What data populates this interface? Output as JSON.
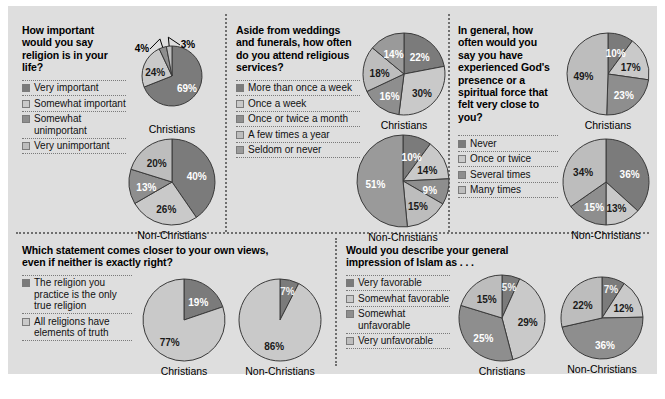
{
  "palette": {
    "board_bg": "#dedede",
    "page_bg": "#ffffff",
    "dark": "#7b7b7b",
    "light": "#c9c9c9",
    "mid_dark": "#8e8e8e",
    "mid_light": "#bdbdbd",
    "outline": "#3a3a3a",
    "divider": "#6f6f6f"
  },
  "labels": {
    "christians": "Christians",
    "non_christians": "Non-Christians"
  },
  "panels": [
    {
      "id": "religion-importance",
      "question": "How important would you say religion is in your life?",
      "legend": [
        {
          "label": "Very important",
          "color": "#7b7b7b"
        },
        {
          "label": "Somewhat important",
          "color": "#c9c9c9"
        },
        {
          "label": "Somewhat unimportant",
          "color": "#8e8e8e"
        },
        {
          "label": "Very unimportant",
          "color": "#bdbdbd"
        }
      ],
      "charts": [
        {
          "group": "Christians",
          "values": [
            69,
            24,
            4,
            3
          ],
          "display": [
            "69%",
            "24%",
            "4%",
            "3%"
          ]
        },
        {
          "group": "Non-Christians",
          "values": [
            40,
            26,
            13,
            20
          ],
          "display": [
            "40%",
            "26%",
            "13%",
            "20%"
          ]
        }
      ]
    },
    {
      "id": "attend-services",
      "question": "Aside from weddings and funerals, how often do you attend religious services?",
      "legend": [
        {
          "label": "More than once a week",
          "color": "#7b7b7b"
        },
        {
          "label": "Once a week",
          "color": "#c9c9c9"
        },
        {
          "label": "Once or twice a month",
          "color": "#8e8e8e"
        },
        {
          "label": "A few times a year",
          "color": "#bdbdbd"
        },
        {
          "label": "Seldom or never",
          "color": "#9a9a9a"
        }
      ],
      "charts": [
        {
          "group": "Christians",
          "values": [
            22,
            30,
            16,
            18,
            14
          ],
          "display": [
            "22%",
            "30%",
            "16%",
            "18%",
            "14%"
          ]
        },
        {
          "group": "Non-Christians",
          "values": [
            10,
            14,
            9,
            15,
            51
          ],
          "display": [
            "10%",
            "14%",
            "9%",
            "15%",
            "51%"
          ]
        }
      ]
    },
    {
      "id": "gods-presence",
      "question": "In general, how often would you say you have experienced God's presence or a spiritual force that felt very close to you?",
      "legend": [
        {
          "label": "Never",
          "color": "#7b7b7b"
        },
        {
          "label": "Once or twice",
          "color": "#c9c9c9"
        },
        {
          "label": "Several times",
          "color": "#8e8e8e"
        },
        {
          "label": "Many times",
          "color": "#bdbdbd"
        }
      ],
      "charts": [
        {
          "group": "Christians",
          "values": [
            10,
            17,
            23,
            49
          ],
          "display": [
            "10%",
            "17%",
            "23%",
            "49%"
          ]
        },
        {
          "group": "Non-Christians",
          "values": [
            36,
            13,
            15,
            34
          ],
          "display": [
            "36%",
            "13%",
            "15%",
            "34%"
          ]
        }
      ]
    },
    {
      "id": "true-religion",
      "question": "Which statement comes closer to your own views, even if neither is exactly right?",
      "legend": [
        {
          "label": "The religion you practice is the only true religion",
          "color": "#7b7b7b"
        },
        {
          "label": "All religions have elements of truth",
          "color": "#c9c9c9"
        }
      ],
      "charts": [
        {
          "group": "Christians",
          "values": [
            19,
            77
          ],
          "display": [
            "19%",
            "77%"
          ]
        },
        {
          "group": "Non-Christians",
          "values": [
            7,
            86
          ],
          "display": [
            "7%",
            "86%"
          ]
        }
      ]
    },
    {
      "id": "impression-islam",
      "question": "Would you describe your general impression of Islam as . . .",
      "legend": [
        {
          "label": "Very favorable",
          "color": "#7b7b7b"
        },
        {
          "label": "Somewhat favorable",
          "color": "#c9c9c9"
        },
        {
          "label": "Somewhat unfavorable",
          "color": "#8e8e8e"
        },
        {
          "label": "Very unfavorable",
          "color": "#bdbdbd"
        }
      ],
      "charts": [
        {
          "group": "Christians",
          "values": [
            5,
            29,
            25,
            15
          ],
          "display": [
            "5%",
            "29%",
            "25%",
            "15%"
          ]
        },
        {
          "group": "Non-Christians",
          "values": [
            7,
            12,
            36,
            22
          ],
          "display": [
            "7%",
            "12%",
            "36%",
            "22%"
          ]
        }
      ]
    }
  ],
  "chart_data": {
    "type": "pie",
    "charts": [
      {
        "question": "How important would you say religion is in your life?",
        "group": "Christians",
        "categories": [
          "Very important",
          "Somewhat important",
          "Somewhat unimportant",
          "Very unimportant"
        ],
        "values": [
          69,
          24,
          4,
          3
        ]
      },
      {
        "question": "How important would you say religion is in your life?",
        "group": "Non-Christians",
        "categories": [
          "Very important",
          "Somewhat important",
          "Somewhat unimportant",
          "Very unimportant"
        ],
        "values": [
          40,
          26,
          13,
          20
        ]
      },
      {
        "question": "Aside from weddings and funerals, how often do you attend religious services?",
        "group": "Christians",
        "categories": [
          "More than once a week",
          "Once a week",
          "Once or twice a month",
          "A few times a year",
          "Seldom or never"
        ],
        "values": [
          22,
          30,
          16,
          18,
          14
        ]
      },
      {
        "question": "Aside from weddings and funerals, how often do you attend religious services?",
        "group": "Non-Christians",
        "categories": [
          "More than once a week",
          "Once a week",
          "Once or twice a month",
          "A few times a year",
          "Seldom or never"
        ],
        "values": [
          10,
          14,
          9,
          15,
          51
        ]
      },
      {
        "question": "In general, how often would you say you have experienced God's presence or a spiritual force that felt very close to you?",
        "group": "Christians",
        "categories": [
          "Never",
          "Once or twice",
          "Several times",
          "Many times"
        ],
        "values": [
          10,
          17,
          23,
          49
        ]
      },
      {
        "question": "In general, how often would you say you have experienced God's presence or a spiritual force that felt very close to you?",
        "group": "Non-Christians",
        "categories": [
          "Never",
          "Once or twice",
          "Several times",
          "Many times"
        ],
        "values": [
          36,
          13,
          15,
          34
        ]
      },
      {
        "question": "Which statement comes closer to your own views, even if neither is exactly right?",
        "group": "Christians",
        "categories": [
          "The religion you practice is the only true religion",
          "All religions have elements of truth"
        ],
        "values": [
          19,
          77
        ]
      },
      {
        "question": "Which statement comes closer to your own views, even if neither is exactly right?",
        "group": "Non-Christians",
        "categories": [
          "The religion you practice is the only true religion",
          "All religions have elements of truth"
        ],
        "values": [
          7,
          86
        ]
      },
      {
        "question": "Would you describe your general impression of Islam as . . .",
        "group": "Christians",
        "categories": [
          "Very favorable",
          "Somewhat favorable",
          "Somewhat unfavorable",
          "Very unfavorable"
        ],
        "values": [
          5,
          29,
          25,
          15
        ]
      },
      {
        "question": "Would you describe your general impression of Islam as . . .",
        "group": "Non-Christians",
        "categories": [
          "Very favorable",
          "Somewhat favorable",
          "Somewhat unfavorable",
          "Very unfavorable"
        ],
        "values": [
          7,
          12,
          36,
          22
        ]
      }
    ]
  }
}
